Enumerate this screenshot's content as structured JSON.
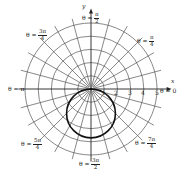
{
  "chart_data": {
    "type": "polar",
    "title": "",
    "grid": {
      "radial_circles": [
        1,
        2,
        3,
        4,
        5
      ],
      "outer_radius": 5.5,
      "spoke_step_degrees": 15
    },
    "axes": {
      "x_label": "x",
      "y_label": "y",
      "r_tick_labels": [
        "1",
        "2",
        "3",
        "4",
        "5"
      ]
    },
    "angle_labels": [
      {
        "id": "theta_0",
        "prefix": "θ = ",
        "value": "0"
      },
      {
        "id": "theta_pi_4",
        "prefix": "θ = ",
        "num": "π",
        "den": "4"
      },
      {
        "id": "theta_pi_2",
        "prefix": "θ = ",
        "num": "π",
        "den": "2"
      },
      {
        "id": "theta_3pi_4",
        "prefix": "θ = ",
        "num": "3π",
        "den": "4"
      },
      {
        "id": "theta_pi",
        "prefix": "θ = ",
        "value": "π"
      },
      {
        "id": "theta_5pi_4",
        "prefix": "θ = ",
        "num": "5π",
        "den": "4"
      },
      {
        "id": "theta_3pi_2",
        "prefix": "θ = ",
        "num": "3π",
        "den": "2"
      },
      {
        "id": "theta_7pi_4",
        "prefix": "θ = ",
        "num": "7π",
        "den": "4"
      }
    ],
    "series": [
      {
        "name": "circle",
        "description": "circle through the pole, centered on negative y-axis",
        "equation": "r = -3.7 sin θ",
        "center": [
          0,
          -1.85
        ],
        "radius": 1.85,
        "color": "#111111"
      }
    ]
  },
  "colors": {
    "grid": "#555555",
    "curve": "#111111",
    "axis": "#222222"
  }
}
